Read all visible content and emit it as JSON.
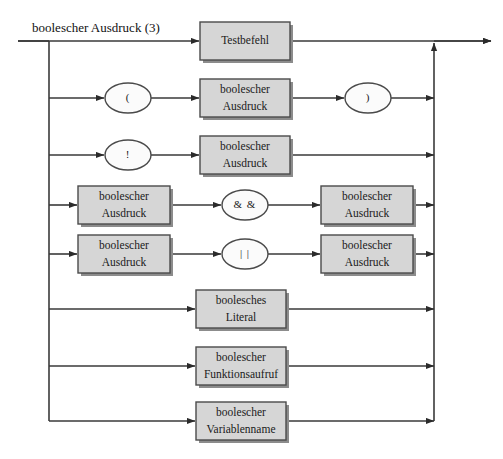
{
  "diagram": {
    "title": "boolescher Ausdruck (3)",
    "type": "railroad-syntax-diagram",
    "language": "de",
    "colors": {
      "box_fill": "#d6d6d6",
      "box_stroke": "#4a4a4a",
      "ellipse_fill": "#fbfbfb",
      "line": "#3a3a3a",
      "text": "#1a1a1a",
      "background": "#ffffff"
    },
    "rails": {
      "entry_label": "boolescher Ausdruck (3)",
      "left_rail_x": 49,
      "right_rail_x": 434,
      "main_line_y": 41,
      "exit_x": 491
    },
    "alternatives": [
      {
        "index": 1,
        "name": "testbefehl",
        "y": 41,
        "elements": [
          {
            "kind": "box",
            "label_line1": "Testbefehl",
            "label_line2": "",
            "x": 200,
            "w": 90
          }
        ]
      },
      {
        "index": 2,
        "name": "parenthesized-expression",
        "y": 98,
        "elements": [
          {
            "kind": "ellipse",
            "label_line1": "(",
            "label_line2": "",
            "x": 105,
            "w": 46
          },
          {
            "kind": "box",
            "label_line1": "boolescher",
            "label_line2": "Ausdruck",
            "x": 200,
            "w": 90
          },
          {
            "kind": "ellipse",
            "label_line1": ")",
            "label_line2": "",
            "x": 345,
            "w": 46
          }
        ]
      },
      {
        "index": 3,
        "name": "negation",
        "y": 155,
        "elements": [
          {
            "kind": "ellipse",
            "label_line1": "!",
            "label_line2": "",
            "x": 105,
            "w": 46
          },
          {
            "kind": "box",
            "label_line1": "boolescher",
            "label_line2": "Ausdruck",
            "x": 200,
            "w": 90
          }
        ]
      },
      {
        "index": 4,
        "name": "logical-and",
        "y": 205,
        "elements": [
          {
            "kind": "box",
            "label_line1": "boolescher",
            "label_line2": "Ausdruck",
            "x": 78,
            "w": 92
          },
          {
            "kind": "ellipse",
            "label_line1": "& &",
            "label_line2": "",
            "x": 222,
            "w": 46
          },
          {
            "kind": "box",
            "label_line1": "boolescher",
            "label_line2": "Ausdruck",
            "x": 321,
            "w": 92
          }
        ]
      },
      {
        "index": 5,
        "name": "logical-or",
        "y": 254,
        "elements": [
          {
            "kind": "box",
            "label_line1": "boolescher",
            "label_line2": "Ausdruck",
            "x": 78,
            "w": 92
          },
          {
            "kind": "ellipse",
            "label_line1": "| |",
            "label_line2": "",
            "x": 222,
            "w": 46
          },
          {
            "kind": "box",
            "label_line1": "boolescher",
            "label_line2": "Ausdruck",
            "x": 321,
            "w": 92
          }
        ]
      },
      {
        "index": 6,
        "name": "boolean-literal",
        "y": 309,
        "elements": [
          {
            "kind": "box",
            "label_line1": "boolesches",
            "label_line2": "Literal",
            "x": 196,
            "w": 90
          }
        ]
      },
      {
        "index": 7,
        "name": "boolean-function-call",
        "y": 366,
        "elements": [
          {
            "kind": "box",
            "label_line1": "boolescher",
            "label_line2": "Funktionsaufruf",
            "x": 196,
            "w": 90
          }
        ]
      },
      {
        "index": 8,
        "name": "boolean-variable-name",
        "y": 421,
        "elements": [
          {
            "kind": "box",
            "label_line1": "boolescher",
            "label_line2": "Variablenname",
            "x": 196,
            "w": 90
          }
        ]
      }
    ]
  }
}
